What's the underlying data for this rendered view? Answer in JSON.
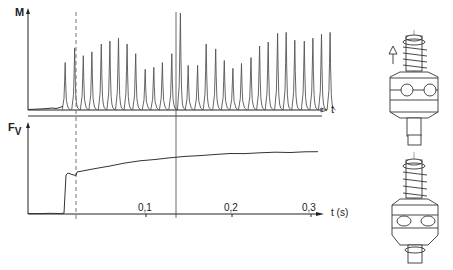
{
  "figure": {
    "top_chart": {
      "y_label": "M",
      "x_label": "t"
    },
    "bottom_chart": {
      "y_label_main": "F",
      "y_label_sub": "V",
      "x_label": "t (s)",
      "x_ticks": [
        "0,1",
        "0,2",
        "0,3"
      ]
    },
    "colors": {
      "ink": "#222222",
      "trace": "#555555",
      "dashed": "#777777",
      "background": "#ffffff"
    },
    "illustrations": [
      {
        "name": "tool-holder-top",
        "arrow": "up"
      },
      {
        "name": "tool-holder-bottom",
        "arrow": "none"
      }
    ]
  },
  "chart_data": [
    {
      "type": "line",
      "title": "",
      "xlabel": "t",
      "ylabel": "M",
      "description": "Torque M vs time: periodic impulse peaks starting at engagement (dashed line ~0.025 s), period ~0.0105 s",
      "x_units": "s",
      "peaks_t": [
        0.02,
        0.031,
        0.041,
        0.051,
        0.062,
        0.072,
        0.082,
        0.092,
        0.102,
        0.113,
        0.123,
        0.133,
        0.144,
        0.154,
        0.163,
        0.174,
        0.184,
        0.195,
        0.205,
        0.215,
        0.225,
        0.236,
        0.246,
        0.256,
        0.267,
        0.277,
        0.287,
        0.298,
        0.308,
        0.318,
        0.328
      ],
      "peaks_relative_height": [
        0.49,
        0.64,
        0.56,
        0.6,
        0.68,
        0.71,
        0.74,
        0.68,
        0.58,
        0.42,
        0.44,
        0.49,
        0.58,
        1.0,
        0.46,
        0.46,
        0.68,
        0.63,
        0.51,
        0.43,
        0.48,
        0.54,
        0.66,
        0.7,
        0.79,
        0.8,
        0.72,
        0.71,
        0.74,
        0.78,
        0.8
      ],
      "ylim": [
        0,
        1.0
      ]
    },
    {
      "type": "line",
      "title": "",
      "xlabel": "t (s)",
      "ylabel": "Fv",
      "x_ticks": [
        0.1,
        0.2,
        0.3
      ],
      "xlim": [
        0,
        0.34
      ],
      "x": [
        0.0,
        0.017,
        0.018,
        0.02,
        0.025,
        0.026,
        0.05,
        0.08,
        0.11,
        0.14,
        0.17,
        0.2,
        0.23,
        0.26,
        0.29,
        0.32
      ],
      "y": [
        0.0,
        0.0,
        0.35,
        0.44,
        0.42,
        0.45,
        0.5,
        0.56,
        0.6,
        0.63,
        0.66,
        0.67,
        0.69,
        0.7,
        0.7,
        0.71
      ],
      "ylim": [
        0,
        1.0
      ]
    }
  ]
}
